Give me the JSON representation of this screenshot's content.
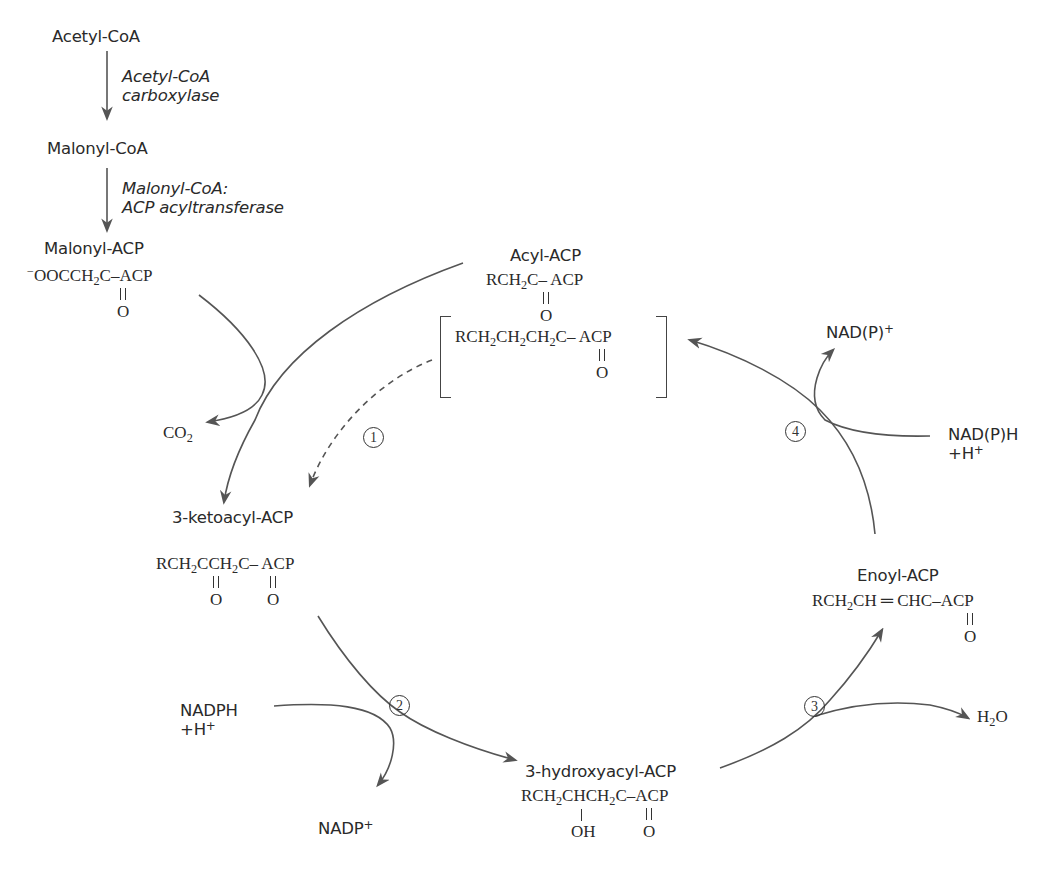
{
  "figure": {
    "stroke_color": "#555555",
    "text_color": "#2a2a2a"
  },
  "linear_pathway": {
    "acetyl_coa": "Acetyl-CoA",
    "enzyme_1_line1": "Acetyl-CoA",
    "enzyme_1_line2": "carboxylase",
    "malonyl_coa": "Malonyl-CoA",
    "enzyme_2_line1": "Malonyl-CoA:",
    "enzyme_2_line2": "ACP acyltransferase",
    "malonyl_acp": "Malonyl-ACP",
    "malonyl_acp_formula": {
      "charge": "−",
      "part1": "OOCCH",
      "sub": "2",
      "part2": "C–ACP",
      "carbonyl_o": "O"
    }
  },
  "cycle": {
    "acyl_acp": {
      "name": "Acyl-ACP",
      "part1": "RCH",
      "sub": "2",
      "part2": "C– ACP",
      "carbonyl_o": "O"
    },
    "elongated_acyl_acp": {
      "part1": "RCH",
      "sub1": "2",
      "part2": "CH",
      "sub2": "2",
      "part3": "CH",
      "sub3": "2",
      "part4": "C– ACP",
      "carbonyl_o": "O"
    },
    "ketoacyl_acp": {
      "name": "3-ketoacyl-ACP",
      "part1": "RCH",
      "sub1": "2",
      "part2": "CCH",
      "sub2": "2",
      "part3": "C– ACP",
      "carbonyl_o1": "O",
      "carbonyl_o2": "O"
    },
    "hydroxyacyl_acp": {
      "name": "3-hydroxyacyl-ACP",
      "part1": "RCH",
      "sub1": "2",
      "part2": "CHCH",
      "sub2": "2",
      "part3": "C–ACP",
      "hydroxyl": "OH",
      "carbonyl_o": "O"
    },
    "enoyl_acp": {
      "name": "Enoyl-ACP",
      "part1": "RCH",
      "sub": "2",
      "part2": "CH ═ CHC–ACP",
      "carbonyl_o": "O"
    }
  },
  "cofactors": {
    "co2": {
      "base": "CO",
      "sub": "2"
    },
    "nadph": "NADPH",
    "nadph_h": {
      "base": "+H",
      "sup": "+"
    },
    "nadp": {
      "base": "NADP",
      "sup": "+"
    },
    "water": {
      "base1": "H",
      "sub": "2",
      "base2": "O"
    },
    "nadph_or_nadh": "NAD(P)H",
    "nadph_or_nadh_h": {
      "base": "+H",
      "sup": "+"
    },
    "nadp_or_nad": {
      "base": "NAD(P)",
      "sup": "+"
    }
  },
  "steps": [
    {
      "id": 1,
      "label": "1"
    },
    {
      "id": 2,
      "label": "2"
    },
    {
      "id": 3,
      "label": "3"
    },
    {
      "id": 4,
      "label": "4"
    }
  ]
}
